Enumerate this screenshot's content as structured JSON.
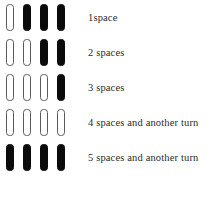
{
  "figure": {
    "colors": {
      "filled": "#0b0b0b",
      "empty_fill": "#ffffff",
      "empty_stroke": "#5a5a5a",
      "text": "#2b2b2b",
      "background": "#ffffff"
    },
    "columns": 4,
    "rows": [
      {
        "label": "1space",
        "cells": [
          "empty",
          "filled",
          "filled",
          "filled"
        ]
      },
      {
        "label": "2 spaces",
        "cells": [
          "empty",
          "empty",
          "filled",
          "filled"
        ]
      },
      {
        "label": "3 spaces",
        "cells": [
          "empty",
          "empty",
          "empty",
          "filled"
        ]
      },
      {
        "label": "4 spaces and another turn",
        "cells": [
          "empty",
          "empty",
          "empty",
          "empty"
        ]
      },
      {
        "label": "5 spaces and another turn",
        "cells": [
          "filled",
          "filled",
          "filled",
          "filled"
        ]
      }
    ]
  }
}
